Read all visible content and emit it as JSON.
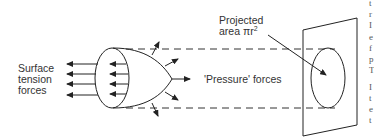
{
  "diagram": {
    "labels": {
      "surface_tension_line1": "Surface",
      "surface_tension_line2": "tension",
      "surface_tension_line3": "forces",
      "pressure_forces": "'Pressure'  forces",
      "projected_line1": "Projected",
      "projected_line2": "area πr",
      "projected_superscript": "2"
    },
    "elements": [
      "bubble-cap",
      "bubble-rim-ellipse",
      "surface-tension-arrows",
      "radial-pressure-arrows",
      "dashed-projection-lines",
      "projection-plane",
      "projected-area-ellipse",
      "projected-area-pointer-arrow"
    ],
    "counts": {
      "outer_surface_tension_arrows": 4,
      "inner_surface_tension_arrows": 4,
      "radial_pressure_arrows": 5
    },
    "colors": {
      "ink": "#222222",
      "text": "#333333",
      "background": "#ffffff"
    }
  },
  "edge_text_fragments": [
    "t",
    "r",
    "I",
    "e",
    "f",
    "p",
    "T",
    "I",
    "t",
    "e",
    "t"
  ]
}
